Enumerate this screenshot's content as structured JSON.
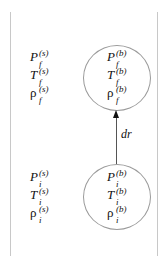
{
  "diagram": {
    "boundaries": {
      "left_line": "left boundary",
      "right_line": "right boundary"
    },
    "surroundings_final": {
      "pressure": {
        "base": "P",
        "sup": "(s)",
        "sub": "f"
      },
      "temperature": {
        "base": "T",
        "sup": "(s)",
        "sub": "f"
      },
      "density": {
        "base": "ρ",
        "sup": "(s)",
        "sub": "f"
      }
    },
    "surroundings_initial": {
      "pressure": {
        "base": "P",
        "sup": "(s)",
        "sub": "i"
      },
      "temperature": {
        "base": "T",
        "sup": "(s)",
        "sub": "i"
      },
      "density": {
        "base": "ρ",
        "sup": "(s)",
        "sub": "i"
      }
    },
    "bubble_final": {
      "pressure": {
        "base": "P",
        "sup": "(b)",
        "sub": "f"
      },
      "temperature": {
        "base": "T",
        "sup": "(b)",
        "sub": "f"
      },
      "density": {
        "base": "ρ",
        "sup": "(b)",
        "sub": "f"
      }
    },
    "bubble_initial": {
      "pressure": {
        "base": "P",
        "sup": "(b)",
        "sub": "i"
      },
      "temperature": {
        "base": "T",
        "sup": "(b)",
        "sub": "i"
      },
      "density": {
        "base": "ρ",
        "sup": "(b)",
        "sub": "i"
      }
    },
    "arrow": {
      "label": "dr",
      "direction": "up"
    },
    "colors": {
      "line": "#c8c8c8",
      "circle": "#9a9a9a",
      "arrow": "#111111",
      "text": "#111111"
    }
  }
}
